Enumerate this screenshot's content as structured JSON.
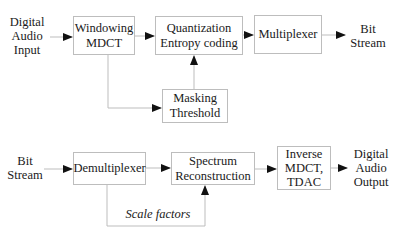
{
  "encoder": {
    "input": [
      "Digital",
      "Audio",
      "Input"
    ],
    "windowing": [
      "Windowing",
      "MDCT"
    ],
    "quantization": [
      "Quantization",
      "Entropy coding"
    ],
    "multiplexer": [
      "Multiplexer"
    ],
    "masking": [
      "Masking",
      "Threshold"
    ],
    "output": [
      "Bit",
      "Stream"
    ]
  },
  "decoder": {
    "input": [
      "Bit",
      "Stream"
    ],
    "demultiplexer": [
      "Demultiplexer"
    ],
    "spectrum": [
      "Spectrum",
      "Reconstruction"
    ],
    "inverse": [
      "Inverse",
      "MDCT,",
      "TDAC"
    ],
    "output": [
      "Digital",
      "Audio",
      "Output"
    ],
    "scale_factors": "Scale factors"
  },
  "colors": {
    "line": "#bdbdbd",
    "arrow": "#111111",
    "text": "#1a1a1a"
  }
}
